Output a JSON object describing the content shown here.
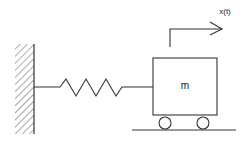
{
  "diagram": {
    "type": "mass-spring system",
    "mass_label": "m",
    "displacement_label": "x(t)",
    "components": [
      "fixed-wall",
      "spring",
      "mass-block",
      "wheels",
      "ground",
      "displacement-arrow"
    ],
    "colors": {
      "stroke": "#333333",
      "background": "#ffffff"
    }
  }
}
